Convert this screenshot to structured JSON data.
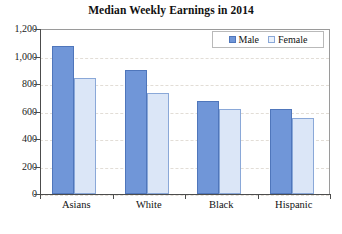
{
  "chart_data": {
    "type": "bar",
    "title": "Median Weekly Earnings in 2014",
    "xlabel": "",
    "ylabel": "",
    "categories": [
      "Asians",
      "White",
      "Black",
      "Hispanic"
    ],
    "series": [
      {
        "name": "Male",
        "values": [
          1080,
          900,
          680,
          620
        ],
        "color": "#7096d8"
      },
      {
        "name": "Female",
        "values": [
          845,
          735,
          615,
          550
        ],
        "color": "#dbe6f7"
      }
    ],
    "ylim": [
      0,
      1200
    ],
    "ytick_step": 200,
    "ytick_labels": [
      "1,200",
      "1,000",
      "800",
      "600",
      "400",
      "200",
      "0"
    ],
    "ytick_values": [
      1200,
      1000,
      800,
      600,
      400,
      200,
      0
    ],
    "grid": true,
    "grid_style": "dashed",
    "legend_position": "top-right-inside"
  },
  "legend": {
    "items": [
      {
        "label": "Male",
        "swatch": "male-swatch"
      },
      {
        "label": "Female",
        "swatch": "female-swatch"
      }
    ]
  }
}
